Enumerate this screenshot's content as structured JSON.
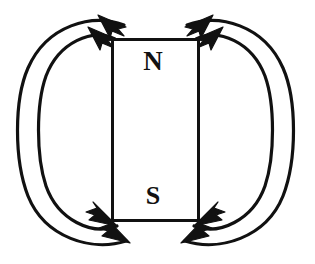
{
  "figure": {
    "kind": "physics-diagram",
    "background_color": "#ffffff",
    "stroke_color": "#111111",
    "width": 315,
    "height": 264
  },
  "magnet": {
    "label_north": "N",
    "label_south": "S",
    "fill_color": "#ffffff",
    "border_color": "#111111",
    "border_width": 3,
    "x": 111,
    "y": 38,
    "width": 89,
    "height": 184
  },
  "field_lines": {
    "count": 4,
    "description": "Two nested closed loops on each side of the magnet",
    "arrow_count": 8,
    "arrows": [
      {
        "id": "top-left-inner",
        "direction": "up-left",
        "side": "left",
        "pole": "N"
      },
      {
        "id": "top-left-outer",
        "direction": "up-left",
        "side": "left",
        "pole": "N"
      },
      {
        "id": "top-right-inner",
        "direction": "up-right",
        "side": "right",
        "pole": "N"
      },
      {
        "id": "top-right-outer",
        "direction": "up-right",
        "side": "right",
        "pole": "N"
      },
      {
        "id": "bottom-left-inner",
        "direction": "right",
        "side": "left",
        "pole": "S"
      },
      {
        "id": "bottom-left-outer",
        "direction": "right",
        "side": "left",
        "pole": "S"
      },
      {
        "id": "bottom-right-inner",
        "direction": "left",
        "side": "right",
        "pole": "S"
      },
      {
        "id": "bottom-right-outer",
        "direction": "left",
        "side": "right",
        "pole": "S"
      }
    ]
  }
}
